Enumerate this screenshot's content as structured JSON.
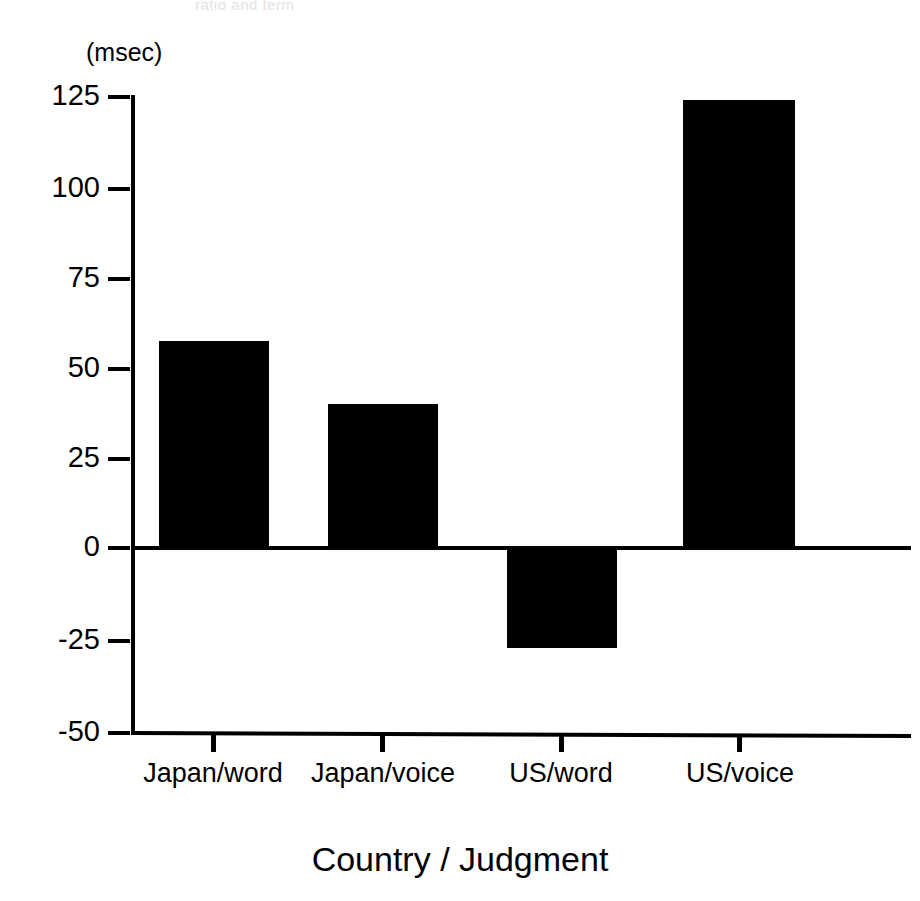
{
  "ghost_text": "ratio and term",
  "chart_data": {
    "type": "bar",
    "title": "",
    "subtitle": "",
    "xlabel": "Country / Judgment",
    "ylabel": "",
    "yunit_label": "(msec)",
    "categories": [
      "Japan/word",
      "Japan/voice",
      "US/word",
      "US/voice"
    ],
    "values": [
      56,
      39,
      -27,
      121
    ],
    "ylim": [
      -50,
      125
    ],
    "yticks": [
      125,
      100,
      75,
      50,
      25,
      0,
      -25,
      -50
    ],
    "ytick_labels": [
      "125",
      "100",
      "75",
      "50",
      "25",
      "0",
      "-25",
      "-50"
    ],
    "grid": false,
    "legend": null,
    "bar_color": "#000000",
    "axis_color": "#000000",
    "background_color": "#ffffff",
    "zero_line": 0,
    "orientation": "vertical"
  }
}
